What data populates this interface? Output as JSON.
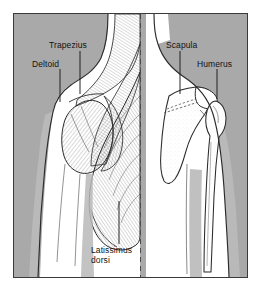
{
  "figure": {
    "kind": "anatomical-illustration",
    "view": "posterior (back) view of shoulder and upper arm",
    "halves": {
      "left": "superficial back musculature",
      "right": "underlying shoulder skeleton"
    },
    "divider": "dashed vertical midline"
  },
  "colors": {
    "background": "#a9a9a9",
    "body_fill": "#ffffff",
    "shadow_fill": "#b9b9b9",
    "outline": "#2b2b2b",
    "frame_border": "#3a3a3a",
    "label_text": "#111111",
    "leader_line": "#1a1a1a",
    "page": "#ffffff"
  },
  "labels": [
    {
      "id": "trapezius",
      "text": "Trapezius",
      "x": 48,
      "y": 40,
      "leader": {
        "x1": 79,
        "y1": 50,
        "x2": 79,
        "y2": 93
      }
    },
    {
      "id": "deltoid",
      "text": "Deltoid",
      "x": 31,
      "y": 58,
      "leader": {
        "x1": 59,
        "y1": 68,
        "x2": 59,
        "y2": 101
      }
    },
    {
      "id": "scapula",
      "text": "Scapula",
      "x": 165,
      "y": 40,
      "leader": {
        "x1": 179,
        "y1": 50,
        "x2": 179,
        "y2": 93
      }
    },
    {
      "id": "humerus",
      "text": "Humerus",
      "x": 196,
      "y": 58,
      "leader": {
        "x1": 216,
        "y1": 68,
        "x2": 216,
        "y2": 98
      }
    },
    {
      "id": "latissimus-dorsi",
      "text_line1": "Latissimus",
      "text_line2": "dorsi",
      "x": 90,
      "y": 244,
      "leader": {
        "x1": 118,
        "y1": 200,
        "x2": 118,
        "y2": 243
      }
    }
  ]
}
